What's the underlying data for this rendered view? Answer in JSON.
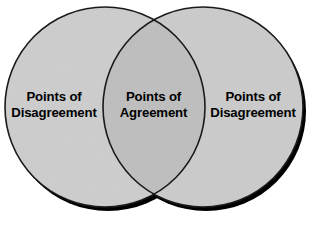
{
  "diagram": {
    "type": "venn",
    "title": "",
    "background_color": "#ffffff",
    "sets": [
      {
        "id": "left-circle",
        "name": "left-set",
        "label_line1": "Points of",
        "label_line2": "Disagreement",
        "fill_color": "#cdcdcd",
        "stroke_color": "#1a1a1a",
        "cx": 105,
        "cy": 107,
        "r": 100
      },
      {
        "id": "right-circle",
        "name": "right-set",
        "label_line1": "Points of",
        "label_line2": "Disagreement",
        "fill_color": "#cbcbcb",
        "stroke_color": "#1a1a1a",
        "cx": 203,
        "cy": 107,
        "r": 100
      }
    ],
    "intersection": {
      "id": "overlap-lens",
      "name": "intersection-set",
      "label_line1": "Points of",
      "label_line2": "Agreement",
      "fill_color": "#bebebe",
      "stroke_color": "#1a1a1a"
    },
    "shadow": {
      "color": "#000000",
      "offset_x": 3,
      "offset_y": 4
    }
  }
}
